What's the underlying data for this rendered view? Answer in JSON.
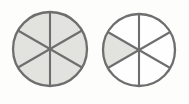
{
  "figure": {
    "background_color": "#fdfdfc",
    "width": 189,
    "height": 104,
    "outline_color": "#6e6e6e",
    "shaded_fill_color": "#e2e2df",
    "unshaded_fill_color": "#fefefe",
    "sector_count_each": 6
  },
  "chart_data": {
    "type": "pie",
    "xlabel": "",
    "ylabel": "",
    "legend": [],
    "grid": false,
    "charts": [
      {
        "name": "left-circle",
        "center_x": 50,
        "center_y": 49,
        "radius": 37,
        "slice_count": 6,
        "slice_angle_degrees": 60,
        "shaded_count": 6,
        "fraction_label": "6/6",
        "categories": [
          "s1",
          "s2",
          "s3",
          "s4",
          "s5",
          "s6"
        ],
        "values": [
          1,
          1,
          1,
          1,
          1,
          1
        ],
        "shaded": [
          true,
          true,
          true,
          true,
          true,
          true
        ]
      },
      {
        "name": "right-circle",
        "center_x": 139,
        "center_y": 50,
        "radius": 36,
        "slice_count": 6,
        "slice_angle_degrees": 60,
        "shaded_count": 1,
        "fraction_label": "1/6",
        "categories": [
          "s1",
          "s2",
          "s3",
          "s4",
          "s5",
          "s6"
        ],
        "values": [
          1,
          1,
          1,
          1,
          1,
          1
        ],
        "shaded": [
          false,
          false,
          false,
          false,
          true,
          false
        ]
      }
    ]
  }
}
